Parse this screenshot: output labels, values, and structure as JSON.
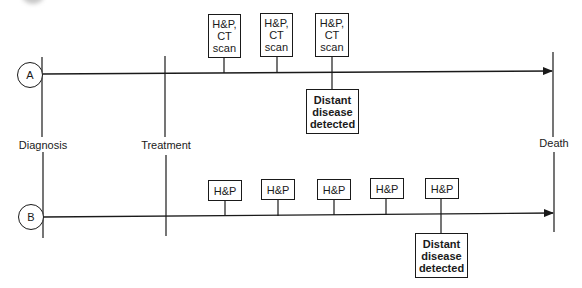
{
  "milestones": {
    "diagnosis": "Diagnosis",
    "treatment": "Treatment",
    "death": "Death"
  },
  "timelines": [
    {
      "id": "A",
      "label": "A",
      "followups": [
        {
          "text_lines": [
            "H&P,",
            "CT",
            "scan"
          ]
        },
        {
          "text_lines": [
            "H&P,",
            "CT",
            "scan"
          ]
        },
        {
          "text_lines": [
            "H&P,",
            "CT",
            "scan"
          ]
        }
      ],
      "event": {
        "text_lines": [
          "Distant",
          "disease",
          "detected"
        ]
      }
    },
    {
      "id": "B",
      "label": "B",
      "followups": [
        {
          "text": "H&P"
        },
        {
          "text": "H&P"
        },
        {
          "text": "H&P"
        },
        {
          "text": "H&P"
        },
        {
          "text": "H&P"
        }
      ],
      "event": {
        "text_lines": [
          "Distant",
          "disease",
          "detected"
        ]
      }
    }
  ],
  "colors": {
    "line": "#1a1a1a",
    "background": "#ffffff"
  }
}
